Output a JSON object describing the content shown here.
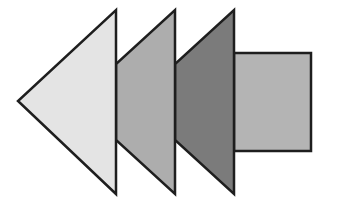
{
  "diagram": {
    "type": "stacked-arrow-shapes",
    "background": "#ffffff",
    "stroke_color": "#1e1e1e",
    "stroke_width": 2.5,
    "shapes": [
      {
        "id": "rect-tail",
        "kind": "rectangle",
        "fill": "#b4b4b4",
        "x": 234,
        "y": 53,
        "width": 77,
        "height": 98
      },
      {
        "id": "triangle-3",
        "kind": "triangle",
        "fill": "#7b7b7b",
        "points": "234,10 234,194 175,140 175,64"
      },
      {
        "id": "triangle-2",
        "kind": "triangle",
        "fill": "#adadad",
        "points": "175,10 175,194 116,140 116,64"
      },
      {
        "id": "triangle-1",
        "kind": "triangle",
        "fill": "#e4e4e4",
        "points": "116,10 116,194 18,101"
      }
    ]
  }
}
